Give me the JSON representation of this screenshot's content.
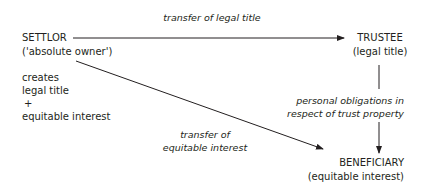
{
  "nodes": {
    "settlor": {
      "label": "SETTLOR",
      "sublabel": "('absolute owner')"
    },
    "settlor_note": {
      "lines": [
        "creates",
        "legal title",
        "+",
        "equitable interest"
      ]
    },
    "trustee": {
      "label": "TRUSTEE",
      "sublabel": "(legal title)"
    },
    "beneficiary": {
      "label": "BENEFICIARY",
      "sublabel": "(equitable interest)"
    }
  },
  "edges": {
    "settlor_to_trustee": {
      "lines": [
        "transfer of legal title"
      ]
    },
    "trustee_to_beneficiary": {
      "lines": [
        "personal obligations in",
        "respect of trust property"
      ]
    },
    "settlor_to_beneficiary": {
      "lines": [
        "transfer of",
        "equitable interest"
      ]
    }
  },
  "colors": {
    "text": "#231f20",
    "line": "#231f20",
    "background": "#ffffff"
  }
}
